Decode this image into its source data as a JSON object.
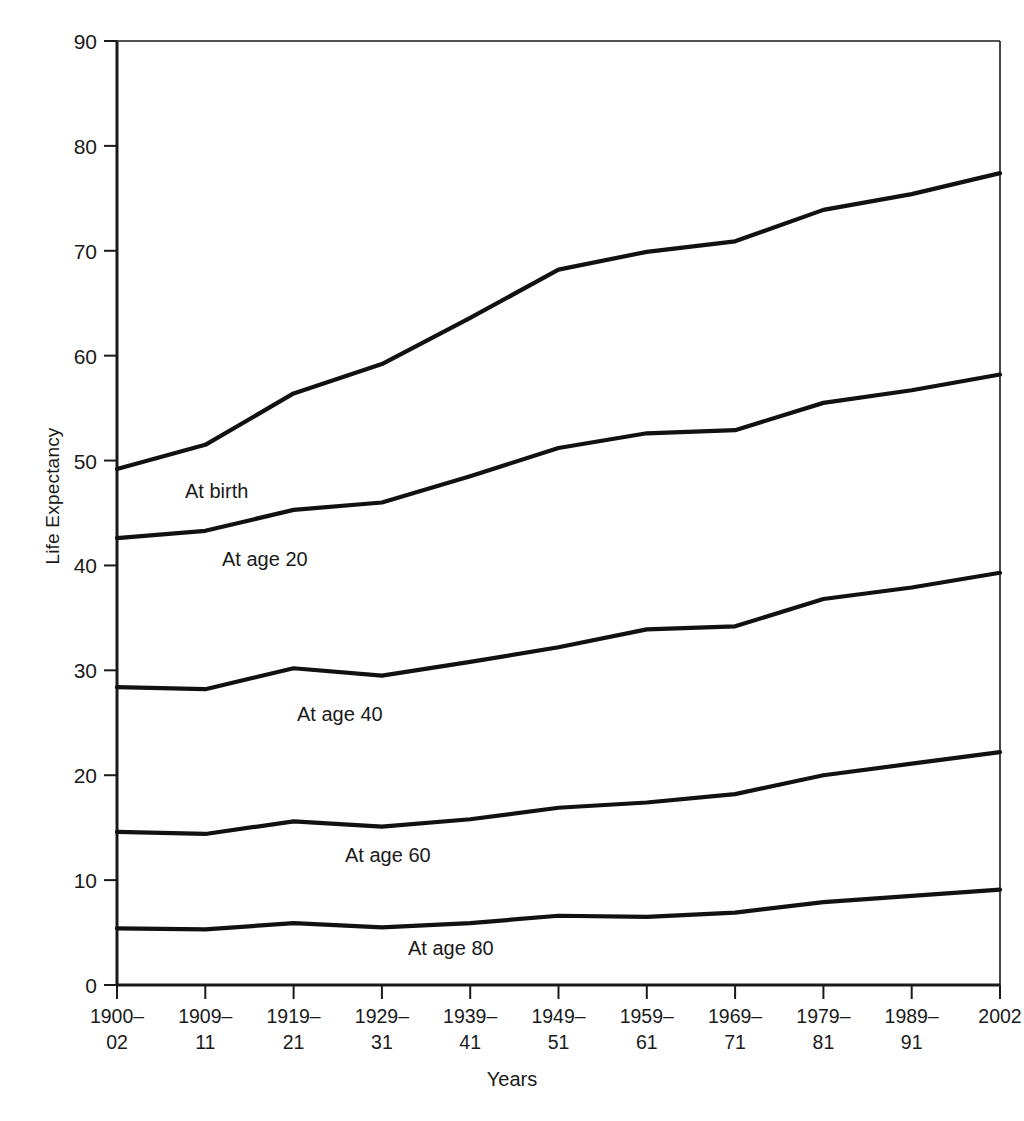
{
  "chart_data": {
    "type": "line",
    "title": "",
    "xlabel": "Years",
    "ylabel": "Life Expectancy",
    "ylim": [
      0,
      90
    ],
    "yticks": [
      0,
      10,
      20,
      30,
      40,
      50,
      60,
      70,
      80,
      90
    ],
    "grid": false,
    "legend_position": "inline-annotations",
    "categories": [
      "1900–02",
      "1909–11",
      "1919–21",
      "1929–31",
      "1939–41",
      "1949–51",
      "1959–61",
      "1969–71",
      "1979–81",
      "1989–91",
      "2002"
    ],
    "categories_lines": [
      [
        "1900–",
        "02"
      ],
      [
        "1909–",
        "11"
      ],
      [
        "1919–",
        "21"
      ],
      [
        "1929–",
        "31"
      ],
      [
        "1939–",
        "41"
      ],
      [
        "1949–",
        "51"
      ],
      [
        "1959–",
        "61"
      ],
      [
        "1969–",
        "71"
      ],
      [
        "1979–",
        "81"
      ],
      [
        "1989–",
        "91"
      ],
      [
        "2002",
        ""
      ]
    ],
    "series": [
      {
        "name": "At birth",
        "values": [
          49.2,
          51.5,
          56.4,
          59.2,
          63.6,
          68.2,
          69.9,
          70.9,
          73.9,
          75.4,
          77.4
        ]
      },
      {
        "name": "At age 20",
        "values": [
          42.6,
          43.3,
          45.3,
          46.0,
          48.5,
          51.2,
          52.6,
          52.9,
          55.5,
          56.7,
          58.2
        ]
      },
      {
        "name": "At age 40",
        "values": [
          28.4,
          28.2,
          30.2,
          29.5,
          30.8,
          32.2,
          33.9,
          34.2,
          36.8,
          37.9,
          39.3
        ]
      },
      {
        "name": "At age 60",
        "values": [
          14.6,
          14.4,
          15.6,
          15.1,
          15.8,
          16.9,
          17.4,
          18.2,
          20.0,
          21.1,
          22.2
        ]
      },
      {
        "name": "At age 80",
        "values": [
          5.4,
          5.3,
          5.9,
          5.5,
          5.9,
          6.6,
          6.5,
          6.9,
          7.9,
          8.5,
          9.1
        ]
      }
    ],
    "series_label_positions": [
      {
        "name": "At birth",
        "x": 185,
        "y": 498
      },
      {
        "name": "At age 20",
        "x": 222,
        "y": 566
      },
      {
        "name": "At age 40",
        "x": 297,
        "y": 721
      },
      {
        "name": "At age 60",
        "x": 345,
        "y": 862
      },
      {
        "name": "At age 80",
        "x": 408,
        "y": 955
      }
    ]
  }
}
